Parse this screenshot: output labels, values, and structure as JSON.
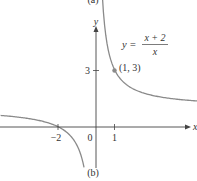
{
  "top_label": "(a)",
  "caption": "(b)",
  "colors": {
    "curve": "#8a8a8a",
    "axis": "#444444",
    "point": "#8a8a8a",
    "text": "#333333"
  },
  "chart_data": {
    "type": "line",
    "title": "",
    "equation": {
      "lhs": "y =",
      "numerator": "x + 2",
      "denominator": "x"
    },
    "xlabel": "x",
    "ylabel": "y",
    "x_ticks": [
      {
        "value": -2,
        "label": "−2"
      },
      {
        "value": 0,
        "label": "0"
      },
      {
        "value": 1,
        "label": "1"
      }
    ],
    "y_ticks": [
      {
        "value": 3,
        "label": "3"
      }
    ],
    "annotations": [
      {
        "x": 1,
        "y": 3,
        "label": "(1, 3)"
      }
    ],
    "series": [
      {
        "name": "y = (x+2)/x, x>0",
        "x": [
          0.35,
          0.5,
          0.75,
          1,
          1.5,
          2,
          3,
          4,
          5.5
        ],
        "y": [
          6.71,
          5,
          3.67,
          3,
          2.33,
          2,
          1.67,
          1.5,
          1.36
        ]
      },
      {
        "name": "y = (x+2)/x, x<0",
        "x": [
          -5,
          -4,
          -3,
          -2,
          -1.5,
          -1,
          -0.8,
          -0.65
        ],
        "y": [
          0.6,
          0.5,
          0.33,
          0,
          -0.33,
          -1,
          -1.5,
          -2.08
        ]
      }
    ],
    "xlim": [
      -5.1,
      5.8
    ],
    "ylim": [
      -2.4,
      6.8
    ],
    "grid": false,
    "legend": "none"
  }
}
